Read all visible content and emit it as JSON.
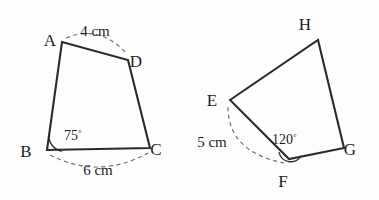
{
  "figures": [
    {
      "name": "quadrilateral-abcd",
      "vertices": [
        {
          "id": "A",
          "label": "A",
          "label_x": 50,
          "label_y": 46,
          "x": 62,
          "y": 42
        },
        {
          "id": "D",
          "label": "D",
          "label_x": 136,
          "label_y": 67,
          "x": 128,
          "y": 60
        },
        {
          "id": "C",
          "label": "C",
          "label_x": 156,
          "label_y": 155,
          "x": 150,
          "y": 148
        },
        {
          "id": "B",
          "label": "B",
          "label_x": 26,
          "label_y": 157,
          "x": 47,
          "y": 150
        }
      ],
      "measures": [
        {
          "name": "side-ad-length",
          "text": "4 cm",
          "x": 95,
          "y": 36
        },
        {
          "name": "side-bc-length",
          "text": "6 cm",
          "x": 98,
          "y": 175
        }
      ],
      "angles": [
        {
          "name": "angle-at-b",
          "value": "75",
          "unit": "°",
          "x": 62,
          "y": 140
        }
      ]
    },
    {
      "name": "quadrilateral-efgh",
      "vertices": [
        {
          "id": "H",
          "label": "H",
          "label_x": 305,
          "label_y": 30,
          "x": 318,
          "y": 40
        },
        {
          "id": "G",
          "label": "G",
          "label_x": 350,
          "label_y": 155,
          "x": 344,
          "y": 148
        },
        {
          "id": "F",
          "label": "F",
          "label_x": 283,
          "label_y": 187,
          "x": 289,
          "y": 159
        },
        {
          "id": "E",
          "label": "E",
          "label_x": 212,
          "label_y": 106,
          "x": 230,
          "y": 100
        }
      ],
      "measures": [
        {
          "name": "side-ef-length",
          "text": "5 cm",
          "x": 212,
          "y": 147
        }
      ],
      "angles": [
        {
          "name": "angle-at-f",
          "value": "120",
          "unit": "°",
          "x": 285,
          "y": 144
        }
      ]
    }
  ],
  "geometry": {
    "abcd_path": "M 62 42 L 128 60 L 150 148 L 47 150 Z",
    "ad_measure_arc": "M 66 38 Q 100 24 127 54",
    "bc_measure_arc": "M 50 155 Q 99 180 148 153",
    "b_angle_arc": "M 49 136 A 15 15 0 0 0 62 151",
    "efgh_path": "M 230 100 L 318 40 L 344 148 L 289 159 Z",
    "ef_measure_arc": "M 228 107 Q 228 152 284 163",
    "f_angle_arc": "M 279 152 A 12 12 0 0 0 301 156"
  },
  "style": {
    "background": "#fdfdfd",
    "edge_color": "#2b2b2f",
    "dash_color": "#6d6d75",
    "text_color": "#1d1d20"
  }
}
